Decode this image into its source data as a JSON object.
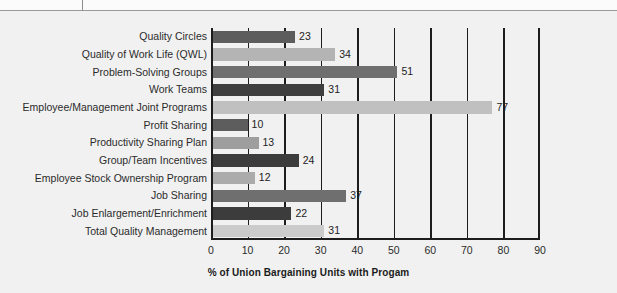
{
  "chart_data": {
    "type": "bar",
    "orientation": "horizontal",
    "title": "",
    "xlabel": "% of Union Bargaining Units with Progam",
    "ylabel": "",
    "xlim": [
      0,
      90
    ],
    "xticks": [
      "0",
      "10",
      "20",
      "30",
      "40",
      "50",
      "60",
      "70",
      "80",
      "90"
    ],
    "grid": true,
    "legend": "none",
    "categories": [
      "Quality Circles",
      "Quality of Work Life (QWL)",
      "Problem-Solving Groups",
      "Work Teams",
      "Employee/Management Joint Programs",
      "Profit Sharing",
      "Productivity Sharing Plan",
      "Group/Team Incentives",
      "Employee Stock Ownership Program",
      "Job Sharing",
      "Job Enlargement/Enrichment",
      "Total Quality Management"
    ],
    "values": [
      23,
      34,
      51,
      31,
      77,
      10,
      13,
      24,
      12,
      37,
      22,
      31
    ],
    "bar_colors": [
      "#5d5d5d",
      "#b4b4b4",
      "#6f6f6f",
      "#3f3f3f",
      "#c0c0c0",
      "#5d5d5d",
      "#9e9e9e",
      "#3c3c3c",
      "#ababab",
      "#6f6f6f",
      "#3c3c3c",
      "#cbcbcb"
    ]
  },
  "colors": {
    "background": "#f1f1f1",
    "axis": "#1d1d1d",
    "text": "#2b2b2b"
  }
}
